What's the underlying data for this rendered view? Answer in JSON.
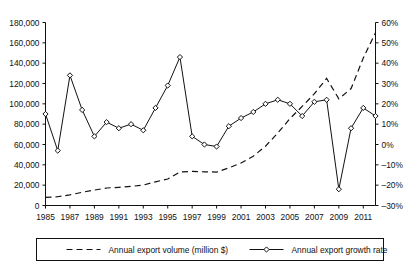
{
  "chart_data": {
    "type": "line",
    "title": "",
    "xlabel": "",
    "ylabel": "",
    "grid": false,
    "x": [
      1985,
      1986,
      1987,
      1988,
      1989,
      1990,
      1991,
      1992,
      1993,
      1994,
      1995,
      1996,
      1997,
      1998,
      1999,
      2000,
      2001,
      2002,
      2003,
      2004,
      2005,
      2006,
      2007,
      2008,
      2009,
      2010,
      2011,
      2012
    ],
    "x_tick_labels": [
      "1985",
      "1987",
      "1989",
      "1991",
      "1993",
      "1995",
      "1997",
      "1999",
      "2001",
      "2003",
      "2005",
      "2007",
      "2009",
      "2011"
    ],
    "x_tick_values": [
      1985,
      1987,
      1989,
      1991,
      1993,
      1995,
      1997,
      1999,
      2001,
      2003,
      2005,
      2007,
      2009,
      2011
    ],
    "xlim": [
      1985,
      2012
    ],
    "left_axis": {
      "label": "",
      "ylim": [
        0,
        180000
      ],
      "tick_values": [
        0,
        20000,
        40000,
        60000,
        80000,
        100000,
        120000,
        140000,
        160000,
        180000
      ],
      "tick_labels": [
        "0",
        "20,000",
        "40,000",
        "60,000",
        "80,000",
        "100,000",
        "120,000",
        "140,000",
        "160,000",
        "180,000"
      ]
    },
    "right_axis": {
      "label": "",
      "ylim": [
        -30,
        60
      ],
      "tick_values": [
        -30,
        -20,
        -10,
        0,
        10,
        20,
        30,
        40,
        50,
        60
      ],
      "tick_labels": [
        "–30%",
        "–20%",
        "–10%",
        "0%",
        "10%",
        "20%",
        "30%",
        "40%",
        "50%",
        "60%"
      ]
    },
    "series": [
      {
        "name": "Annual export volume (million $)",
        "axis": "left",
        "style": "dashed",
        "marker": "none",
        "color": "#111111",
        "values": [
          8000,
          8600,
          10500,
          13000,
          15200,
          17200,
          17900,
          18800,
          20100,
          23300,
          26100,
          33000,
          33500,
          33100,
          32900,
          37000,
          41800,
          48500,
          58300,
          71200,
          85500,
          97500,
          110000,
          125000,
          105000,
          115000,
          145000,
          170000
        ]
      },
      {
        "name": "Annual export growth rate",
        "axis": "right",
        "style": "solid",
        "marker": "diamond",
        "color": "#111111",
        "values": [
          15,
          -3,
          34,
          17,
          4,
          11,
          8,
          10,
          7,
          18,
          29,
          43,
          4,
          0,
          -1,
          9,
          13,
          16,
          20,
          22,
          20,
          14,
          21,
          22,
          -22,
          8,
          18,
          14
        ]
      }
    ],
    "legend": {
      "position": "bottom",
      "entries": [
        {
          "label": "Annual export volume (million $)",
          "style": "dashed",
          "marker": "none"
        },
        {
          "label": "Annual export growth rate",
          "style": "solid",
          "marker": "diamond"
        }
      ]
    }
  }
}
